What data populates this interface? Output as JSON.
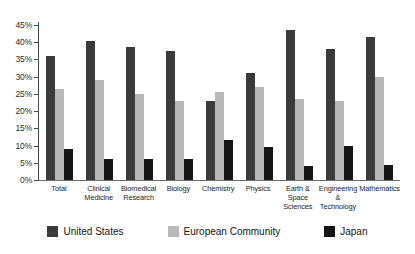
{
  "chart_data": {
    "type": "bar",
    "title": "",
    "xlabel": "",
    "ylabel": "",
    "ylim": [
      0,
      45
    ],
    "ytick_values": [
      45,
      40,
      35,
      30,
      25,
      20,
      15,
      10,
      5,
      0
    ],
    "ytick_labels": [
      "45%",
      "40%",
      "35%",
      "30%",
      "25%",
      "20%",
      "15%",
      "10%",
      "5%",
      "0%"
    ],
    "grid": false,
    "legend_position": "bottom",
    "categories": [
      "Total",
      "Clinical Medicine",
      "Biomedical Research",
      "Biology",
      "Chemistry",
      "Physics",
      "Earth & Space Sciences",
      "Engineering & Technology",
      "Mathematics"
    ],
    "category_lines": [
      [
        "Total"
      ],
      [
        "Clinical",
        "Medicine"
      ],
      [
        "Biomedical",
        "Research"
      ],
      [
        "Biology"
      ],
      [
        "Chemistry"
      ],
      [
        "Physics"
      ],
      [
        "Earth &",
        "Space",
        "Sciences"
      ],
      [
        "Engineering",
        "& Technology"
      ],
      [
        "Mathematics"
      ]
    ],
    "series": [
      {
        "name": "United States",
        "color": "#3b3b3b",
        "values": [
          36.0,
          40.5,
          38.5,
          37.5,
          23.0,
          31.0,
          43.5,
          38.0,
          41.5
        ]
      },
      {
        "name": "European Community",
        "color": "#b9b9b9",
        "values": [
          26.5,
          29.0,
          25.0,
          23.0,
          25.5,
          27.0,
          23.5,
          23.0,
          30.0
        ]
      },
      {
        "name": "Japan",
        "color": "#151515",
        "values": [
          9.0,
          6.0,
          6.0,
          6.0,
          11.5,
          9.5,
          4.0,
          10.0,
          4.5
        ]
      }
    ]
  },
  "legend": {
    "items": [
      {
        "label": "United States",
        "swatch_class": "us"
      },
      {
        "label": "European Community",
        "swatch_class": "ec"
      },
      {
        "label": "Japan",
        "swatch_class": "jp"
      }
    ]
  }
}
